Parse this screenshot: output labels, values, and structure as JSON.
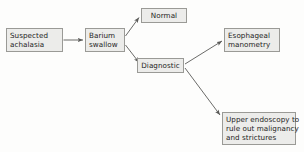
{
  "diagram": {
    "colors": {
      "node_fill": "#ececea",
      "node_border": "#9a9a96",
      "text": "#1c1c1c",
      "edge": "#5a5a58",
      "background": "#fdfdfc"
    },
    "nodes": [
      {
        "id": "suspected",
        "lines": [
          "Suspected",
          "achalasia"
        ]
      },
      {
        "id": "barium",
        "lines": [
          "Barium",
          "swallow"
        ]
      },
      {
        "id": "normal",
        "lines": [
          "Normal"
        ]
      },
      {
        "id": "diagnostic",
        "lines": [
          "Diagnostic"
        ]
      },
      {
        "id": "manometry",
        "lines": [
          "Esophageal",
          "manometry"
        ]
      },
      {
        "id": "endoscopy",
        "lines": [
          "Upper endoscopy to",
          "rule out malignancy",
          "and strictures"
        ]
      }
    ],
    "edges": [
      {
        "id": "suspected-to-barium",
        "from": "suspected",
        "to": "barium",
        "label": ""
      },
      {
        "id": "barium-to-normal",
        "from": "barium",
        "to": "normal",
        "label": ""
      },
      {
        "id": "barium-to-diagnostic",
        "from": "barium",
        "to": "diagnostic",
        "label": ""
      },
      {
        "id": "diagnostic-to-manometry",
        "from": "diagnostic",
        "to": "manometry",
        "label": ""
      },
      {
        "id": "diagnostic-to-endoscopy",
        "from": "diagnostic",
        "to": "endoscopy",
        "label": ""
      }
    ]
  }
}
